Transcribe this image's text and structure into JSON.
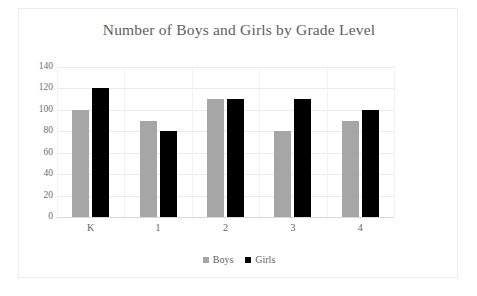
{
  "chart_data": {
    "type": "bar",
    "title": "Number of Boys and Girls by Grade Level",
    "xlabel": "",
    "ylabel": "",
    "categories": [
      "K",
      "1",
      "2",
      "3",
      "4"
    ],
    "series": [
      {
        "name": "Boys",
        "color": "#a6a6a6",
        "values": [
          100,
          90,
          110,
          80,
          90
        ]
      },
      {
        "name": "Girls",
        "color": "#000000",
        "values": [
          120,
          80,
          110,
          110,
          100
        ]
      }
    ],
    "ylim": [
      0,
      140
    ],
    "yticks": [
      0,
      20,
      40,
      60,
      80,
      100,
      120,
      140
    ],
    "ytick_labels": [
      "0",
      "20",
      "40",
      "60",
      "80",
      "100",
      "120",
      "140"
    ],
    "grid": true,
    "grid_color": "#ebebeb",
    "legend_position": "bottom-center",
    "title_color": "#5e5e5e",
    "background": "#ffffff",
    "border_color": "#ededed"
  },
  "legend": {
    "items": [
      {
        "label": "Boys"
      },
      {
        "label": "Girls"
      }
    ]
  }
}
